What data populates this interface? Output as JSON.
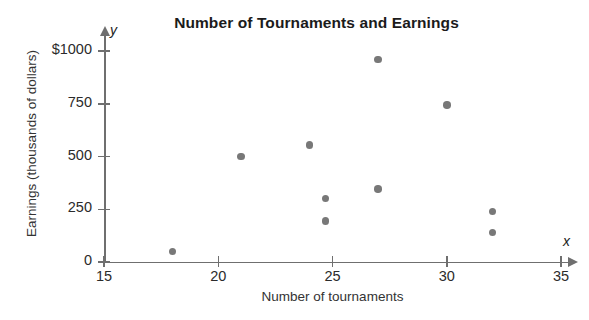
{
  "chart_data": {
    "type": "scatter",
    "title": "Number of Tournaments and Earnings",
    "xlabel": "Number of tournaments",
    "ylabel": "Earnings (thousands of dollars)",
    "x_axis_variable": "x",
    "y_axis_variable": "y",
    "xlim": [
      15,
      35
    ],
    "ylim": [
      0,
      1000
    ],
    "xticks": [
      15,
      20,
      25,
      30,
      35
    ],
    "xtick_labels": [
      "15",
      "20",
      "25",
      "30",
      "35"
    ],
    "yticks": [
      0,
      250,
      500,
      750,
      1000
    ],
    "ytick_labels": [
      "0",
      "250",
      "500",
      "750",
      "$1000"
    ],
    "grid": false,
    "legend": null,
    "marker_color": "#787878",
    "axis_color": "#6f6f6f",
    "points": [
      {
        "x": 18,
        "y": 50
      },
      {
        "x": 21,
        "y": 500
      },
      {
        "x": 24,
        "y": 555
      },
      {
        "x": 24.7,
        "y": 300
      },
      {
        "x": 24.7,
        "y": 195
      },
      {
        "x": 27,
        "y": 960
      },
      {
        "x": 27,
        "y": 345
      },
      {
        "x": 30,
        "y": 745
      },
      {
        "x": 32,
        "y": 240
      },
      {
        "x": 32,
        "y": 140
      }
    ]
  }
}
